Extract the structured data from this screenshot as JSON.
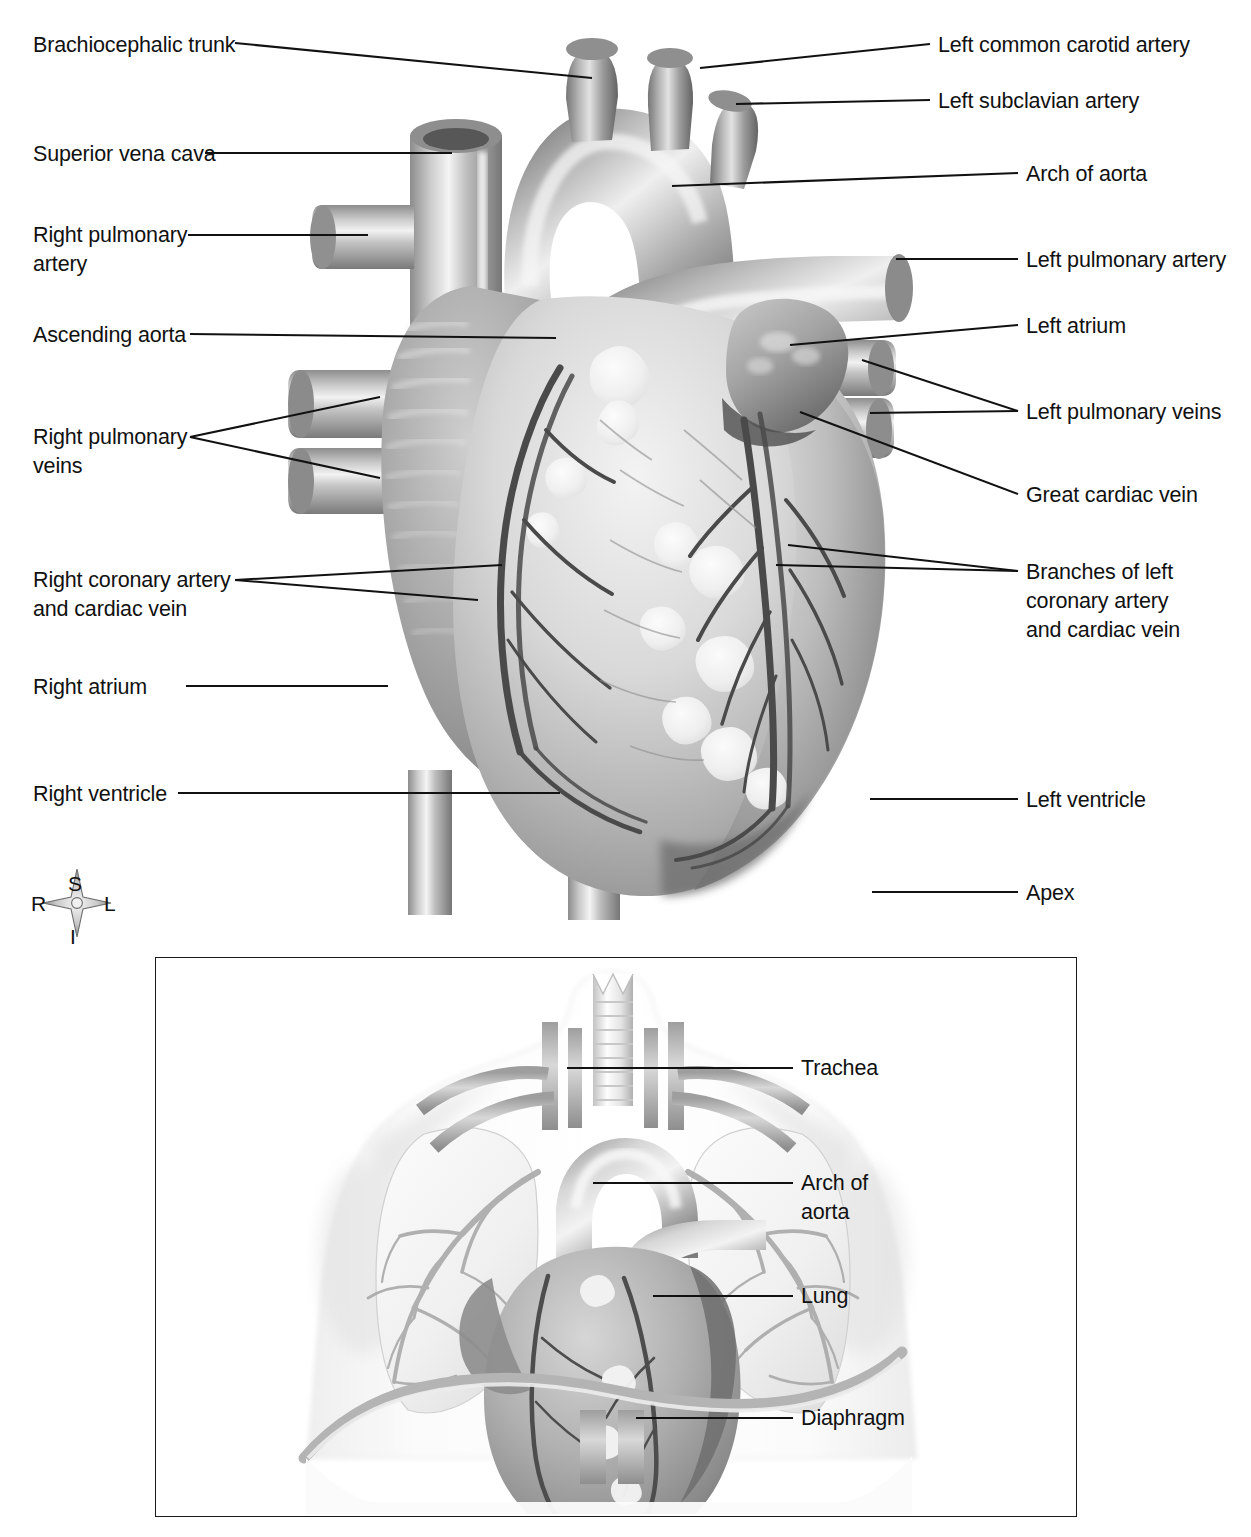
{
  "figure": {
    "type": "anatomical-illustration",
    "orientation_compass": {
      "superior": "S",
      "inferior": "I",
      "right": "R",
      "left": "L"
    }
  },
  "main_labels_left": [
    {
      "id": "brachiocephalic-trunk",
      "text": "Brachiocephalic trunk"
    },
    {
      "id": "superior-vena-cava",
      "text": "Superior vena cava"
    },
    {
      "id": "right-pulmonary-artery",
      "text": "Right pulmonary\nartery"
    },
    {
      "id": "ascending-aorta",
      "text": "Ascending aorta"
    },
    {
      "id": "right-pulmonary-veins",
      "text": "Right pulmonary\nveins"
    },
    {
      "id": "right-coronary-artery",
      "text": "Right coronary artery\nand cardiac vein"
    },
    {
      "id": "right-atrium",
      "text": "Right atrium"
    },
    {
      "id": "right-ventricle",
      "text": "Right ventricle"
    }
  ],
  "main_labels_right": [
    {
      "id": "left-common-carotid-artery",
      "text": "Left common carotid artery"
    },
    {
      "id": "left-subclavian-artery",
      "text": "Left subclavian artery"
    },
    {
      "id": "arch-of-aorta",
      "text": "Arch of aorta"
    },
    {
      "id": "left-pulmonary-artery",
      "text": "Left pulmonary artery"
    },
    {
      "id": "left-atrium",
      "text": "Left atrium"
    },
    {
      "id": "left-pulmonary-veins",
      "text": "Left pulmonary veins"
    },
    {
      "id": "great-cardiac-vein",
      "text": "Great cardiac vein"
    },
    {
      "id": "branches-left-coronary",
      "text": "Branches of left\ncoronary artery\nand cardiac vein"
    },
    {
      "id": "left-ventricle",
      "text": "Left ventricle"
    },
    {
      "id": "apex",
      "text": "Apex"
    }
  ],
  "inset_labels": [
    {
      "id": "trachea",
      "text": "Trachea"
    },
    {
      "id": "arch-of-aorta-inset",
      "text": "Arch of\naorta"
    },
    {
      "id": "lung",
      "text": "Lung"
    },
    {
      "id": "diaphragm",
      "text": "Diaphragm"
    }
  ],
  "colors": {
    "ink": "#111111",
    "leader_line": "#111111",
    "inset_border": "#1a1a1a",
    "page_background": "#ffffff",
    "tissue_light": "#e3e3e3",
    "tissue_mid": "#b4b4b4",
    "tissue_dark": "#7d7d7d",
    "vessel_dark": "#5c5c5c"
  }
}
